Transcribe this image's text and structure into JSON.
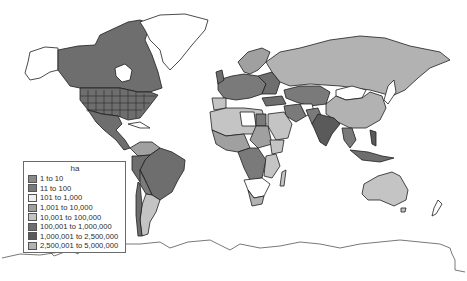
{
  "legend": {
    "title": "ha",
    "items": [
      {
        "label": "1 to 10",
        "color": "#8a8a8a"
      },
      {
        "label": "11 to 100",
        "color": "#7a7a7a"
      },
      {
        "label": "101 to 1,000",
        "color": "#efefef"
      },
      {
        "label": "1,001 to 10,000",
        "color": "#a0a0a0"
      },
      {
        "label": "10,001 to 100,000",
        "color": "#c4c4c4"
      },
      {
        "label": "100,001 to 1,000,000",
        "color": "#6e6e6e"
      },
      {
        "label": "1,000,001 to 2,500,000",
        "color": "#5a5a5a"
      },
      {
        "label": "2,500,001 to 5,000,000",
        "color": "#b2b2b2"
      }
    ]
  },
  "map": {
    "type": "world choropleth",
    "unit": "ha",
    "ocean_color": "#ffffff",
    "no_data_color": "#ffffff",
    "border_color": "#1e1e1e"
  }
}
